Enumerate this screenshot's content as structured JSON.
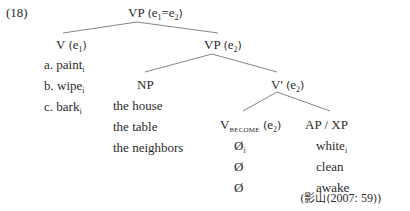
{
  "example_number": "(18)",
  "tree": {
    "root": {
      "label": "VP",
      "paren_open": "(",
      "e1": "e",
      "e1_sub": "1",
      "eq": "=",
      "e2": "e",
      "e2_sub": "2",
      "paren_close": ")"
    },
    "v": {
      "label": "V",
      "paren_open": "(",
      "e": "e",
      "e_sub": "1",
      "paren_close": ")"
    },
    "verbs": [
      {
        "prefix": "a.",
        "word": "paint",
        "sub": "i"
      },
      {
        "prefix": "b.",
        "word": "wipe",
        "sub": "i"
      },
      {
        "prefix": "c.",
        "word": "bark",
        "sub": "i"
      }
    ],
    "vp2": {
      "label": "VP",
      "paren_open": "(",
      "e": "e",
      "e_sub": "2",
      "paren_close": ")"
    },
    "np": {
      "label": "NP"
    },
    "nps": [
      "the house",
      "the table",
      "the neighbors"
    ],
    "vbar": {
      "label": "V'",
      "paren_open": "(",
      "e": "e",
      "e_sub": "2",
      "paren_close": ")"
    },
    "vbecome": {
      "label": "V",
      "sub": "BECOME",
      "paren_open": "(",
      "e": "e",
      "e_sub": "2",
      "paren_close": ")"
    },
    "apxp": {
      "label": "AP / XP"
    },
    "nulls": [
      {
        "symbol": "Ø",
        "sub": "i"
      },
      {
        "symbol": "Ø",
        "sub": ""
      },
      {
        "symbol": "Ø",
        "sub": ""
      }
    ],
    "adjectives": [
      {
        "word": "white",
        "sub": "i"
      },
      {
        "word": "clean",
        "sub": ""
      },
      {
        "word": "awake",
        "sub": ""
      }
    ]
  },
  "citation": {
    "open": "(",
    "author": "影山",
    "year_open": "(",
    "year": "2007: 59",
    "year_close": ")",
    "close": ")"
  }
}
